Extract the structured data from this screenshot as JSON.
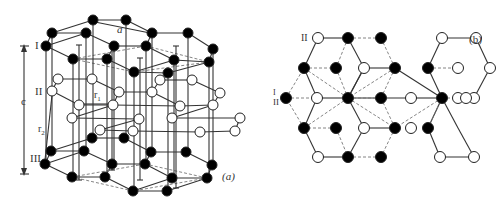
{
  "figure": {
    "panel_a": {
      "caption": "(a)",
      "layer_labels": [
        "I",
        "II",
        "III"
      ],
      "dimension_labels": {
        "lattice_a": "a",
        "lattice_c": "c",
        "r1": "r",
        "r1_sub": "1",
        "r2": "r",
        "r2_sub": "2"
      },
      "layers": {
        "I": {
          "fill": "#000000",
          "nodes": [
            [
              93,
              20
            ],
            [
              126,
              20
            ],
            [
              52,
              33
            ],
            [
              86,
              33
            ],
            [
              152,
              33
            ],
            [
              188,
              33
            ],
            [
              46,
              46
            ],
            [
              114,
              46
            ],
            [
              146,
              46
            ],
            [
              213,
              49
            ],
            [
              73,
              59
            ],
            [
              107,
              59
            ],
            [
              174,
              60
            ],
            [
              209,
              62
            ],
            [
              134,
              72
            ],
            [
              168,
              73
            ]
          ]
        },
        "II": {
          "fill": "#ffffff",
          "nodes": [
            [
              58,
              79
            ],
            [
              92,
              79
            ],
            [
              160,
              80
            ],
            [
              192,
              80
            ],
            [
              52,
              91
            ],
            [
              119,
              92
            ],
            [
              152,
              92
            ],
            [
              220,
              93
            ],
            [
              79,
              105
            ],
            [
              113,
              105
            ],
            [
              180,
              106
            ],
            [
              213,
              105
            ],
            [
              72,
              118
            ],
            [
              139,
              119
            ],
            [
              172,
              118
            ],
            [
              240,
              118
            ],
            [
              100,
              130
            ],
            [
              133,
              131
            ],
            [
              200,
              132
            ],
            [
              235,
              131
            ]
          ]
        },
        "III": {
          "fill": "#000000",
          "nodes": [
            [
              92,
              138
            ],
            [
              124,
              138
            ],
            [
              51,
              151
            ],
            [
              84,
              151
            ],
            [
              151,
              152
            ],
            [
              186,
              152
            ],
            [
              45,
              164
            ],
            [
              112,
              164
            ],
            [
              145,
              164
            ],
            [
              212,
              165
            ],
            [
              72,
              177
            ],
            [
              105,
              177
            ],
            [
              172,
              178
            ],
            [
              207,
              178
            ],
            [
              133,
              191
            ],
            [
              167,
              191
            ]
          ]
        }
      }
    },
    "panel_b": {
      "caption": "(b)",
      "labels": [
        "II",
        "I",
        "II"
      ],
      "white_nodes": [
        [
          318,
          38
        ],
        [
          442,
          38
        ],
        [
          476,
          38
        ],
        [
          364,
          68
        ],
        [
          458,
          68
        ],
        [
          317,
          98
        ],
        [
          411,
          98
        ],
        [
          458,
          98
        ],
        [
          364,
          128
        ],
        [
          411,
          128
        ],
        [
          318,
          157
        ],
        [
          440,
          157
        ],
        [
          474,
          157
        ],
        [
          466,
          98
        ]
      ],
      "black_nodes": [
        [
          348,
          38
        ],
        [
          381,
          38
        ],
        [
          304,
          68
        ],
        [
          336,
          68
        ],
        [
          395,
          68
        ],
        [
          428,
          68
        ],
        [
          286,
          98
        ],
        [
          348,
          98
        ],
        [
          381,
          98
        ],
        [
          442,
          98
        ],
        [
          304,
          128
        ],
        [
          336,
          128
        ],
        [
          395,
          128
        ],
        [
          428,
          128
        ],
        [
          348,
          157
        ],
        [
          381,
          157
        ]
      ]
    }
  }
}
